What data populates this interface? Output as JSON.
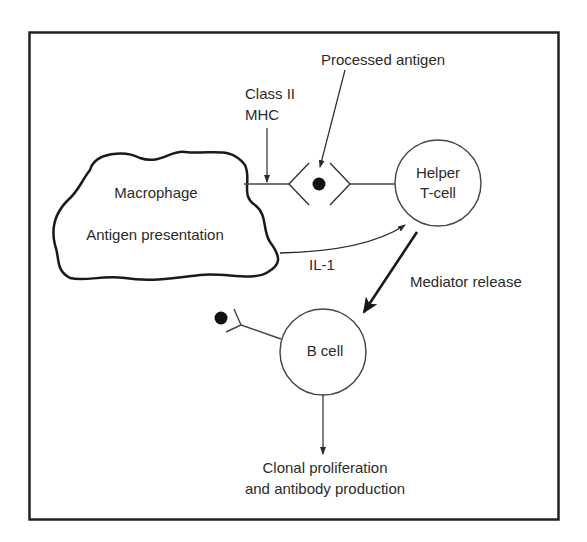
{
  "diagram": {
    "type": "immune-response-flow",
    "colors": {
      "line": "#2b2b2b",
      "frame": "#222222",
      "background": "#ffffff"
    },
    "nodes": {
      "macrophage": {
        "title": "Macrophage",
        "subtitle": "Antigen presentation",
        "shape": "cloud"
      },
      "helper_t_cell": {
        "line1": "Helper",
        "line2": "T-cell",
        "shape": "circle"
      },
      "b_cell": {
        "label": "B cell",
        "shape": "circle"
      },
      "antigen_complex": {
        "shape": "diamond-with-dot"
      }
    },
    "labels": {
      "processed_antigen": "Processed antigen",
      "class_ii_line1": "Class II",
      "class_ii_line2": "MHC",
      "il1": "IL-1",
      "mediator_release": "Mediator release",
      "outcome_line1": "Clonal proliferation",
      "outcome_line2": "and antibody production"
    },
    "edges": [
      {
        "from": "macrophage",
        "to": "helper_t_cell",
        "label": "IL-1"
      },
      {
        "from": "helper_t_cell",
        "to": "b_cell",
        "label": "Mediator release"
      },
      {
        "from": "b_cell",
        "to": "outcome",
        "label": "Clonal proliferation and antibody production"
      }
    ]
  }
}
